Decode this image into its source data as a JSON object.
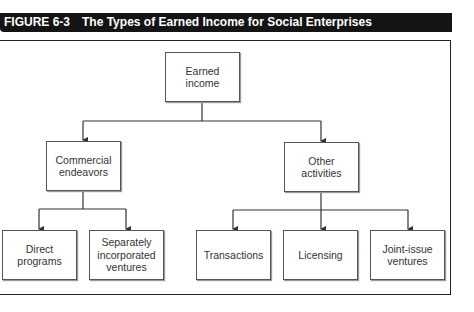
{
  "header": {
    "figure_number": "FIGURE 6-3",
    "title": "The Types of Earned Income for Social Enterprises"
  },
  "diagram": {
    "root": {
      "label_line1": "Earned",
      "label_line2": "income"
    },
    "level1": [
      {
        "label_line1": "Commercial",
        "label_line2": "endeavors"
      },
      {
        "label_line1": "Other",
        "label_line2": "activities"
      }
    ],
    "level2": [
      {
        "parent": "Commercial endeavors",
        "label_line1": "Direct",
        "label_line2": "programs",
        "label_line3": ""
      },
      {
        "parent": "Commercial endeavors",
        "label_line1": "Separately",
        "label_line2": "incorporated",
        "label_line3": "ventures"
      },
      {
        "parent": "Other activities",
        "label_line1": "Transactions",
        "label_line2": "",
        "label_line3": ""
      },
      {
        "parent": "Other activities",
        "label_line1": "Licensing",
        "label_line2": "",
        "label_line3": ""
      },
      {
        "parent": "Other activities",
        "label_line1": "Joint-issue",
        "label_line2": "ventures",
        "label_line3": ""
      }
    ]
  },
  "colors": {
    "title_bg": "#141414",
    "title_fg": "#ffffff",
    "line": "#333333",
    "box_border": "#555555"
  }
}
